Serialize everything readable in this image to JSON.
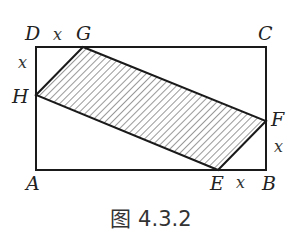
{
  "figure": {
    "caption": "图 4.3.2",
    "points": {
      "A": {
        "label": "A",
        "x": 36,
        "y": 170
      },
      "B": {
        "label": "B",
        "x": 266,
        "y": 170
      },
      "C": {
        "label": "C",
        "x": 266,
        "y": 47
      },
      "D": {
        "label": "D",
        "x": 36,
        "y": 47
      },
      "E": {
        "label": "E",
        "x": 218,
        "y": 170
      },
      "F": {
        "label": "F",
        "x": 266,
        "y": 121
      },
      "G": {
        "label": "G",
        "x": 83,
        "y": 47
      },
      "H": {
        "label": "H",
        "x": 36,
        "y": 95
      }
    },
    "segment_labels": {
      "DG": "x",
      "DH": "x",
      "EB": "x",
      "BF": "x"
    },
    "shaded_region": "EFGH",
    "colors": {
      "line": "#1a1a1a",
      "hatch": "#444444"
    }
  }
}
